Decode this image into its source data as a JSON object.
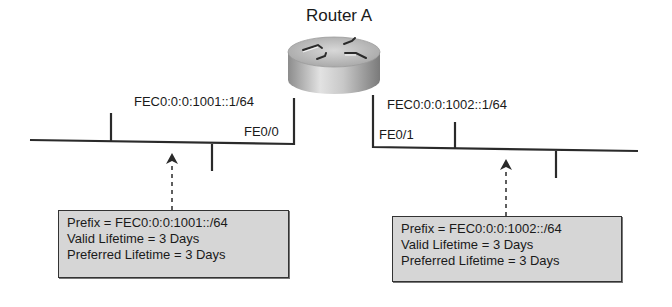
{
  "router": {
    "name": "Router A"
  },
  "interfaces": [
    {
      "name": "FE0/0",
      "address": "FEC0:0:0:1001::1/64"
    },
    {
      "name": "FE0/1",
      "address": "FEC0:0:0:1002::1/64"
    }
  ],
  "advertisements": [
    {
      "prefix": "Prefix = FEC0:0:0:1001::/64",
      "valid_lifetime": "Valid Lifetime = 3 Days",
      "preferred_lifetime": "Preferred Lifetime = 3 Days"
    },
    {
      "prefix": "Prefix = FEC0:0:0:1002::/64",
      "valid_lifetime": "Valid Lifetime = 3 Days",
      "preferred_lifetime": "Preferred Lifetime = 3 Days"
    }
  ],
  "colors": {
    "line": "#2a2a2a",
    "box_fill": "#d6d6d6",
    "router_body": "#b8b8b8"
  }
}
